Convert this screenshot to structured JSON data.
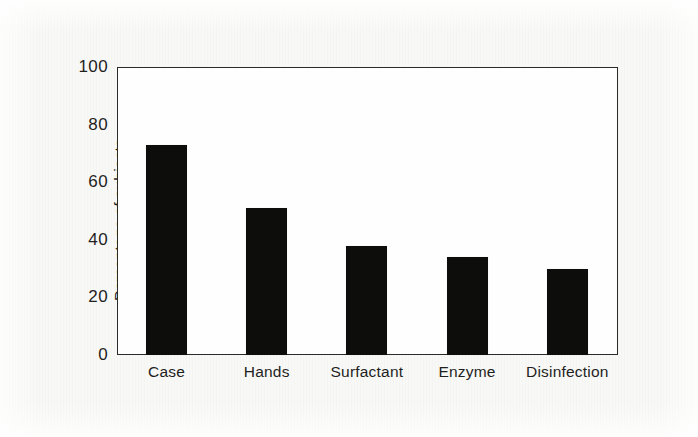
{
  "chart_data": {
    "type": "bar",
    "title": "",
    "subtitle": "",
    "xlabel": "",
    "ylabel": "Percentage of subjects",
    "categories": [
      "Case",
      "Hands",
      "Surfactant",
      "Enzyme",
      "Disinfection"
    ],
    "values": [
      73,
      51,
      38,
      34,
      30
    ],
    "series": [
      {
        "name": "Percentage of subjects",
        "values": [
          73,
          51,
          38,
          34,
          30
        ]
      }
    ],
    "ylim": [
      0,
      100
    ],
    "ytick_labels": [
      "0",
      "20",
      "40",
      "60",
      "80",
      "100"
    ],
    "ytick_values": [
      0,
      20,
      40,
      60,
      80,
      100
    ],
    "grid": false,
    "legend": false,
    "legend_position": "none",
    "bar_color": "#0d0d0c",
    "frame_color": "#2a2a28",
    "plot_background": "#fefefe",
    "page_background": "#f8f8f6",
    "annotations": []
  }
}
